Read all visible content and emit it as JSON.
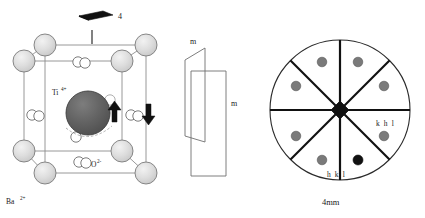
{
  "figure": {
    "left_panel": {
      "name": "barium-titanate-unit-cell",
      "symmetry_symbol": {
        "glyph": "filled-lens-4-fold-axis",
        "label": "4"
      },
      "ion_labels": [
        {
          "id": "titanium",
          "text": "Ti",
          "superscript": "4+"
        },
        {
          "id": "oxygen",
          "text": "O",
          "superscript": "2-"
        },
        {
          "id": "barium",
          "text": "Ba",
          "superscript": "2+"
        }
      ],
      "mirror_plane_labels": [
        {
          "id": "mirror-upper",
          "text": "m"
        },
        {
          "id": "mirror-lower",
          "text": "m"
        }
      ],
      "displacement_arrows": [
        {
          "id": "arrow-up-titanium",
          "direction": "up"
        },
        {
          "id": "arrow-down-oxygen",
          "direction": "down"
        }
      ],
      "colors": {
        "barium_sphere": "#d9d9d9",
        "titanium_sphere": "#5f5f5f",
        "oxygen_circle": "#ffffff",
        "cell_edge": "#888888",
        "outline": "#4d4d4d",
        "symbol_fill": "#111111"
      },
      "counts": {
        "barium_spheres": 8,
        "titanium_spheres": 1,
        "oxygen_circles": 12
      }
    },
    "right_panel": {
      "name": "stereographic-projection-4mm",
      "point_group_label": "4mm",
      "center_symbol": "filled-square-4-fold-axis",
      "sector_count": 8,
      "mirror_line_count": 4,
      "index_labels": [
        {
          "id": "khl",
          "text": "k h l"
        },
        {
          "id": "hkl",
          "text": "h k l"
        }
      ],
      "poles": [
        {
          "id": "pole-1",
          "sector": 1,
          "fill": "#7a7a7a"
        },
        {
          "id": "pole-2",
          "sector": 2,
          "fill": "#7a7a7a"
        },
        {
          "id": "pole-3",
          "sector": 3,
          "fill": "#7a7a7a"
        },
        {
          "id": "pole-4",
          "sector": 4,
          "fill": "#7a7a7a"
        },
        {
          "id": "pole-5",
          "sector": 5,
          "fill": "#111111"
        },
        {
          "id": "pole-6",
          "sector": 6,
          "fill": "#7a7a7a"
        },
        {
          "id": "pole-7",
          "sector": 7,
          "fill": "#7a7a7a"
        },
        {
          "id": "pole-8",
          "sector": 8,
          "fill": "#7a7a7a"
        }
      ],
      "colors": {
        "circle_outline": "#2a2a2a",
        "mirror_line": "#111111",
        "pole_gray": "#7a7a7a",
        "pole_black": "#111111"
      }
    }
  }
}
